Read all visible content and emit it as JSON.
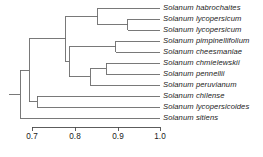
{
  "figure": {
    "kind": "phylogenetic-tree",
    "title": "",
    "background_color": "#ffffff",
    "branch_color": "#6a6a6a",
    "axis_color": "#4a4a4a",
    "text_color": "#1a1a1a"
  },
  "chart_data": {
    "type": "tree",
    "title": "",
    "xlabel": "",
    "ylabel": "",
    "xlim": [
      0.672,
      1.0
    ],
    "grid": false,
    "legend": null,
    "axis": {
      "tick_values": [
        0.7,
        0.8,
        0.9,
        1.0
      ],
      "tick_labels": [
        "0.7",
        "0.8",
        "0.9",
        "1.0"
      ],
      "tick_px": [
        32,
        75,
        118,
        160
      ],
      "line_y_px": 127,
      "direction": "similarity-increasing-right"
    },
    "tips": [
      {
        "index": 0,
        "label": "Solanum habrochaites",
        "y_px": 8,
        "node_x": 0.854
      },
      {
        "index": 1,
        "label": "Solanum lycopersicum",
        "y_px": 19,
        "node_x": 0.924
      },
      {
        "index": 2,
        "label": "Solanum lycopersicum",
        "y_px": 30,
        "node_x": 0.924
      },
      {
        "index": 3,
        "label": "Solanum pimpinellifolium",
        "y_px": 41,
        "node_x": 0.896
      },
      {
        "index": 4,
        "label": "Solanum cheesmaniae",
        "y_px": 52,
        "node_x": 0.896
      },
      {
        "index": 5,
        "label": "Solanum chmielewskii",
        "y_px": 63,
        "node_x": 0.874
      },
      {
        "index": 6,
        "label": "Solanum pennellii",
        "y_px": 74,
        "node_x": 0.874
      },
      {
        "index": 7,
        "label": "Solanum peruvianum",
        "y_px": 85,
        "node_x": 0.836
      },
      {
        "index": 8,
        "label": "Solanum chilense",
        "y_px": 96,
        "node_x": 0.712
      },
      {
        "index": 9,
        "label": "Solanum lycopersicoides",
        "y_px": 107,
        "node_x": 0.712
      },
      {
        "index": 10,
        "label": "Solanum sitiens",
        "y_px": 118,
        "node_x": 0.672
      }
    ],
    "internal_nodes": [
      {
        "name": "lycopersicum-pair",
        "x": 0.924,
        "children_y_px": [
          19,
          30
        ],
        "y_px": 24.5
      },
      {
        "name": "habrochaites-clade",
        "x": 0.854,
        "children_y_px": [
          8,
          24.5
        ],
        "y_px": 16.25
      },
      {
        "name": "pimpinellifolium-cheesmaniae",
        "x": 0.896,
        "children_y_px": [
          41,
          52
        ],
        "y_px": 46.5
      },
      {
        "name": "chmielewskii-pennellii",
        "x": 0.874,
        "children_y_px": [
          63,
          74
        ],
        "y_px": 68.5
      },
      {
        "name": "peruvianum-clade",
        "x": 0.836,
        "children_y_px": [
          68.5,
          85
        ],
        "y_px": 76.75
      },
      {
        "name": "esculentum-complex-lower",
        "x": 0.787,
        "children_y_px": [
          46.5,
          76.75
        ],
        "y_px": 61.6
      },
      {
        "name": "tomato-clade",
        "x": 0.779,
        "children_y_px": [
          16.25,
          61.6
        ],
        "y_px": 38.9
      },
      {
        "name": "chilense-lycopersicoides",
        "x": 0.712,
        "children_y_px": [
          96,
          107
        ],
        "y_px": 101.5
      },
      {
        "name": "tomato-plus-lycopersicoides",
        "x": 0.694,
        "children_y_px": [
          38.9,
          101.5
        ],
        "y_px": 70.2
      },
      {
        "name": "root",
        "x": 0.672,
        "children_y_px": [
          70.2,
          118
        ],
        "y_px": 94.1
      }
    ],
    "root_stub": {
      "from_x": 0.645,
      "to_x": 0.672,
      "y_px": 94.1
    }
  }
}
